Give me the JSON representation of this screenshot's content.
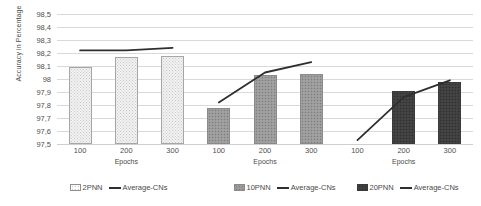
{
  "chart_data": {
    "type": "bar",
    "title": "",
    "subtitle": "",
    "xlabel": "Epochs",
    "ylabel": "Accuracy in Percentage",
    "ylim": [
      97.5,
      98.5
    ],
    "ytick_labels": [
      "98,5",
      "98,4",
      "98,3",
      "98,2",
      "98,1",
      "98",
      "97,9",
      "97,8",
      "97,7",
      "97,6",
      "97,5"
    ],
    "ytick_values": [
      98.5,
      98.4,
      98.3,
      98.2,
      98.1,
      98.0,
      97.9,
      97.8,
      97.7,
      97.6,
      97.5
    ],
    "grid": true,
    "legend_position": "bottom",
    "categories": [
      "100",
      "200",
      "300"
    ],
    "groups": [
      {
        "name": "2PNN",
        "fill": "light",
        "color": "#f2f2f2",
        "bar_values": [
          98.09,
          98.17,
          98.18
        ],
        "line_name": "Average-CNs",
        "line_color": "#2f2f2f",
        "line_values": [
          98.22,
          98.22,
          98.24
        ]
      },
      {
        "name": "10PNN",
        "fill": "medium",
        "color": "#9a9a9a",
        "bar_values": [
          97.78,
          98.03,
          98.04
        ],
        "line_name": "Average-CNs",
        "line_color": "#2f2f2f",
        "line_values": [
          97.82,
          98.05,
          98.13
        ]
      },
      {
        "name": "20PNN",
        "fill": "dark",
        "color": "#3f3f3f",
        "bar_values": [
          null,
          97.91,
          97.98
        ],
        "line_name": "Average-CNs",
        "line_color": "#2f2f2f",
        "line_values": [
          97.53,
          97.86,
          97.99
        ]
      }
    ]
  },
  "legend": {
    "entries": [
      {
        "swatch_label": "2PNN",
        "line_label": "Average-CNs"
      },
      {
        "swatch_label": "10PNN",
        "line_label": "Average-CNs"
      },
      {
        "swatch_label": "20PNN",
        "line_label": "Average-CNs"
      }
    ]
  },
  "axes": {
    "x_title_repeat": [
      "Epochs",
      "Epochs",
      "Epochs"
    ]
  }
}
